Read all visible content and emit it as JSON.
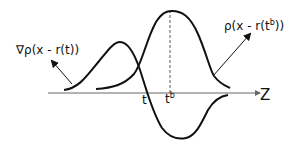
{
  "diagram": {
    "labels": {
      "gradient_curve": "∇ρ(x - r(t))",
      "density_curve": "ρ(x - r(t",
      "density_curve_sup": "b",
      "density_curve_end": "))",
      "t_marker": "t",
      "tb_marker": "t",
      "tb_marker_sup": "b",
      "axis": "Z"
    },
    "curves": [
      {
        "name": "gradient-curve",
        "description": "derivative of density (positive lobe left, negative lobe right)"
      },
      {
        "name": "density-curve",
        "description": "bell-shaped density centered at t^b"
      }
    ],
    "colors": {
      "stroke": "#111111",
      "background": "#ffffff"
    }
  }
}
